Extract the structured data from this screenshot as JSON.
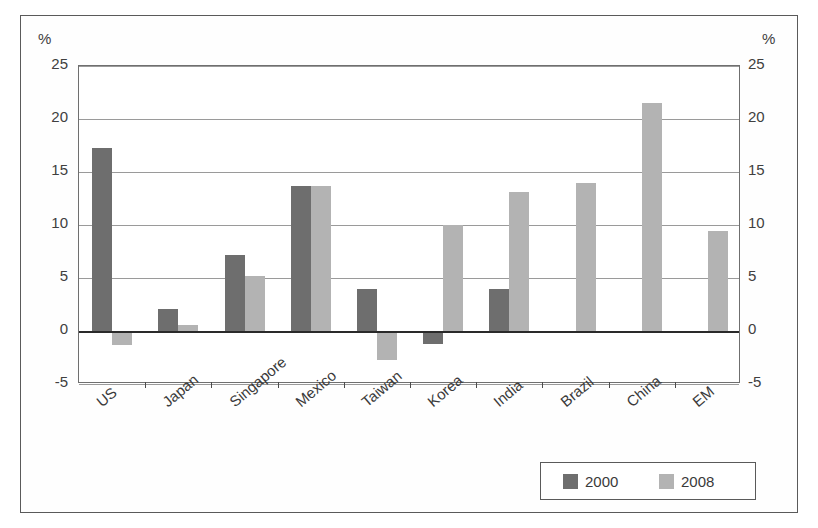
{
  "chart_data": {
    "type": "bar",
    "title": "",
    "subtitle": "",
    "xlabel": "",
    "ylabel": "%",
    "ylabel_right": "%",
    "ylim": [
      -5,
      25
    ],
    "ytick_step": 5,
    "yticks": [
      "25",
      "20",
      "15",
      "10",
      "5",
      "0",
      "-5"
    ],
    "ytick_values": [
      25,
      20,
      15,
      10,
      5,
      0,
      -5
    ],
    "grid": true,
    "grid_axis": "y",
    "zero_line": true,
    "dual_axis": true,
    "legend_position": "bottom-right",
    "categories": [
      "US",
      "Japan",
      "Singapore",
      "Mexico",
      "Taiwan",
      "Korea",
      "India",
      "Brazil",
      "China",
      "EM"
    ],
    "series": [
      {
        "name": "2000",
        "color": "#6e6e6e",
        "values": [
          17.3,
          2.1,
          7.2,
          13.7,
          4.0,
          -1.2,
          4.0,
          null,
          null,
          null
        ]
      },
      {
        "name": "2008",
        "color": "#b3b3b3",
        "values": [
          -1.3,
          0.6,
          5.2,
          13.7,
          -2.7,
          10.0,
          13.1,
          14.0,
          21.5,
          9.4
        ]
      }
    ]
  },
  "legend": {
    "entries": [
      {
        "label": "2000",
        "color": "#6e6e6e"
      },
      {
        "label": "2008",
        "color": "#b3b3b3"
      }
    ]
  },
  "axes": {
    "left_unit": "%",
    "right_unit": "%"
  },
  "colors": {
    "series_2000": "#6e6e6e",
    "series_2008": "#b3b3b3",
    "gridline": "#9a9a9a",
    "zero_line": "#2a2a2a",
    "frame": "#5a5a5a",
    "background": "#ffffff"
  }
}
